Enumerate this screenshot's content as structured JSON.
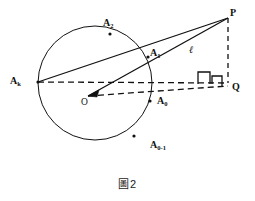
{
  "figure": {
    "caption_glyph": "圖",
    "caption_number": "2",
    "caption_full": "圖 2",
    "stroke_color": "#111111",
    "background_color": "#ffffff",
    "points": [
      {
        "id": "P",
        "label": "P",
        "sub": "",
        "x": 228,
        "y": 18,
        "label_x": 230,
        "label_y": 8,
        "marker": false
      },
      {
        "id": "Q",
        "label": "Q",
        "sub": "",
        "x": 228,
        "y": 83,
        "label_x": 232,
        "label_y": 82,
        "marker": false
      },
      {
        "id": "Ak",
        "label": "A",
        "sub": "k",
        "x": 38,
        "y": 82,
        "label_x": 10,
        "label_y": 76,
        "marker": true
      },
      {
        "id": "A1",
        "label": "A",
        "sub": "1",
        "x": 148,
        "y": 57,
        "label_x": 150,
        "label_y": 48,
        "marker": true
      },
      {
        "id": "A2",
        "label": "A",
        "sub": "2",
        "x": 110,
        "y": 34,
        "label_x": 103,
        "label_y": 18,
        "marker": true
      },
      {
        "id": "A0",
        "label": "A",
        "sub": "0",
        "x": 150,
        "y": 101,
        "label_x": 157,
        "label_y": 96,
        "marker": true
      },
      {
        "id": "A0m1",
        "label": "A",
        "sub": "0-1",
        "x": 134,
        "y": 136,
        "label_x": 150,
        "label_y": 140,
        "marker": true
      },
      {
        "id": "O",
        "label": "O",
        "sub": "",
        "x": 88,
        "y": 96,
        "label_x": 81,
        "label_y": 98,
        "marker": false
      }
    ],
    "circle": {
      "cx": 95,
      "cy": 83,
      "r": 57
    },
    "line_label": {
      "text": "ℓ",
      "x": 189,
      "y": 45
    },
    "solid_segments": [
      {
        "name": "Ak-to-P",
        "x1": 38,
        "y1": 82,
        "x2": 228,
        "y2": 18
      },
      {
        "name": "O-to-P",
        "x1": 88,
        "y1": 96,
        "x2": 228,
        "y2": 18
      }
    ],
    "dashed_segments": [
      {
        "name": "Ak-to-Q",
        "x1": 38,
        "y1": 82,
        "x2": 228,
        "y2": 83
      },
      {
        "name": "O-to-Q",
        "x1": 88,
        "y1": 96,
        "x2": 228,
        "y2": 86
      },
      {
        "name": "P-to-Q",
        "x1": 228,
        "y1": 18,
        "x2": 228,
        "y2": 83
      }
    ],
    "right_angle_markers": [
      {
        "name": "right-angle-left",
        "path": "M 198 84 L 198 72 L 210 72 L 210 84"
      },
      {
        "name": "right-angle-right",
        "path": "M 212 84 L 212 76 L 222 76 L 222 86"
      }
    ],
    "arrowheads": [
      {
        "name": "arrow-to-O",
        "x": 88,
        "y": 96,
        "angle": 209
      }
    ]
  }
}
